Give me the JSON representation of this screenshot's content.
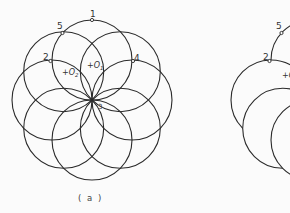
{
  "diagram": {
    "left": {
      "caption": "( a )",
      "center": [
        92,
        100
      ],
      "circle_radius": 40,
      "circle_count": 8,
      "points": [
        {
          "label": "1",
          "x": 92,
          "y": 20
        },
        {
          "label": "5",
          "x": 62,
          "y": 33
        },
        {
          "label": "2",
          "x": 52,
          "y": 61
        },
        {
          "label": "4",
          "x": 133,
          "y": 61
        },
        {
          "label": "3",
          "x": 92,
          "y": 100
        }
      ],
      "centers": [
        {
          "label": "O",
          "sub": "1",
          "x": 90,
          "y": 67
        },
        {
          "label": "O",
          "sub": "2",
          "x": 64,
          "y": 74
        }
      ]
    },
    "right": {
      "offset_x": 219,
      "points": [
        {
          "label": "5",
          "x": 281,
          "y": 33
        },
        {
          "label": "2",
          "x": 271,
          "y": 61
        }
      ],
      "center_label": {
        "label": "O",
        "x": 285,
        "y": 76
      }
    },
    "colors": {
      "stroke": "#2a2a2a",
      "background": "#fbfbfb"
    }
  }
}
